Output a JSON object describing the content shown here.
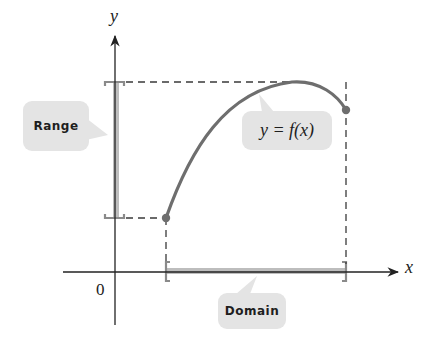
{
  "diagram": {
    "axes": {
      "x_label": "x",
      "y_label": "y",
      "origin_label": "0"
    },
    "labels": {
      "range": "Range",
      "domain": "Domain",
      "function": "y = f(x)"
    },
    "colors": {
      "curve": "#6e6e6e",
      "axis": "#2a2a2a",
      "interval_bar": "#bdbdbd",
      "bracket": "#8a8a8a",
      "bubble_fill": "#e4e4e4",
      "dashed_guide": "#3a3a3a"
    },
    "curve": {
      "start_point": "closed dot at left endpoint (x=a, minimum y)",
      "end_point": "closed dot at right endpoint (x=b)",
      "shape": "increasing concave-down arc reaching a maximum then decreasing slightly"
    }
  }
}
